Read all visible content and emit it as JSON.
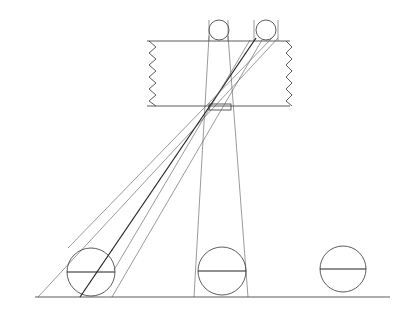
{
  "diagram": {
    "type": "pinhole-projection-line-drawing",
    "stroke_color": "#333333",
    "background": "#ffffff",
    "camera_box": {
      "x1": 147,
      "y1": 41,
      "x2": 290,
      "y2": 106,
      "left_zigzag_teeth": 10,
      "right_zigzag_teeth": 10
    },
    "aperture": {
      "x": 209,
      "y": 104,
      "w": 22,
      "h": 6,
      "cx": 219,
      "cy": 108
    },
    "image_circles": [
      {
        "id": "image-left",
        "cx": 219,
        "cy": 30,
        "r": 10
      },
      {
        "id": "image-right",
        "cx": 266,
        "cy": 30,
        "r": 10
      }
    ],
    "ground_line": {
      "x1": 35,
      "y1": 297,
      "x2": 390,
      "y2": 297
    },
    "objects": [
      {
        "id": "ball-left",
        "cx": 91,
        "cy": 272,
        "r": 24
      },
      {
        "id": "ball-middle",
        "cx": 222,
        "cy": 271,
        "r": 24
      },
      {
        "id": "ball-right",
        "cx": 343,
        "cy": 269,
        "r": 23
      }
    ]
  }
}
